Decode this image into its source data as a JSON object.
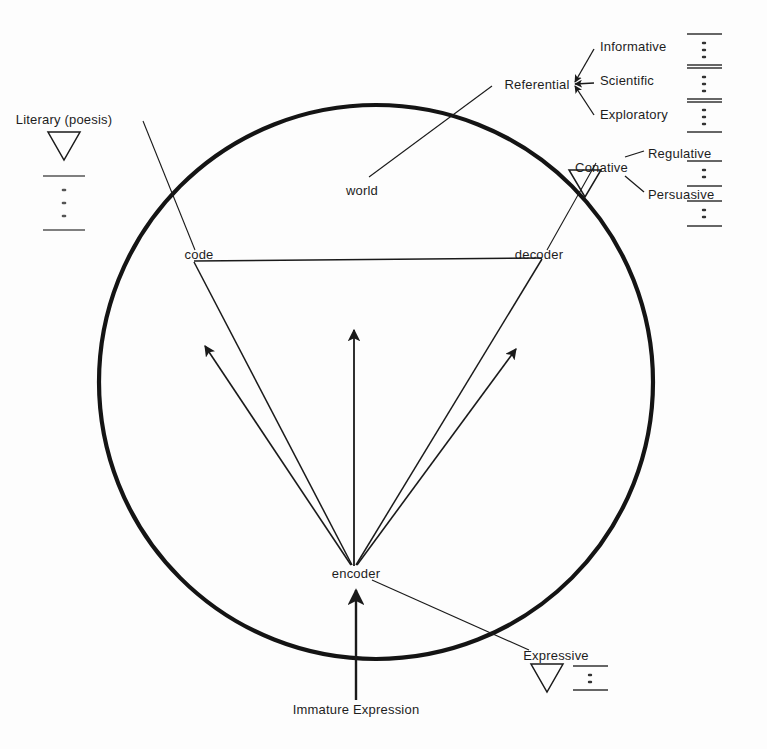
{
  "diagram": {
    "stroke_color": "#1a1a1a",
    "circle_color": "#111111",
    "background": "#fdfdfd",
    "core_nodes": {
      "code": "code",
      "decoder": "decoder",
      "encoder": "encoder",
      "world": "world"
    },
    "functions": {
      "referential": "Referential",
      "conative": "Conative",
      "expressive": "Expressive",
      "literary": "Literary (poesis)"
    },
    "referential_branches": [
      "Informative",
      "Scientific",
      "Exploratory"
    ],
    "conative_branches": [
      "Regulative",
      "Persuasive"
    ],
    "inputs": {
      "immature_expression": "Immature Expression"
    },
    "symbols": {
      "triangle": "triangle-down-glyph",
      "ladder": "ladder-dots-glyph"
    }
  }
}
